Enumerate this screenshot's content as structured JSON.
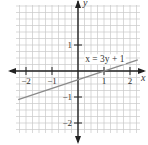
{
  "chart_data": {
    "type": "line",
    "title": "",
    "xlabel": "x",
    "ylabel": "y",
    "xlim": [
      -2.4,
      2.4
    ],
    "ylim": [
      -2.4,
      2.6
    ],
    "grid": true,
    "grid_step": 0.25,
    "x_ticks": [
      -2,
      -1,
      1,
      2
    ],
    "x_tick_labels": [
      "−2",
      "−1",
      "1",
      "2"
    ],
    "y_ticks": [
      1,
      -1,
      -2
    ],
    "y_tick_labels": [
      "1",
      "−1",
      "−2"
    ],
    "series": [
      {
        "name": "x = 3y + 1",
        "equation": "x = 3y + 1",
        "x": [
          -2.3,
          2.3
        ],
        "y": [
          -1.1,
          0.43
        ]
      }
    ],
    "annotations": [
      {
        "text": "x = 3y + 1",
        "x": 0.2,
        "y": 0.45
      }
    ],
    "colors": {
      "grid": "#c8c8c8",
      "axis": "#222222",
      "line": "#8a8a8a"
    }
  }
}
